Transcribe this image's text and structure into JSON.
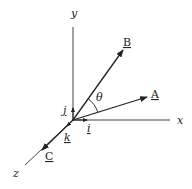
{
  "diagram": {
    "type": "3d-vector-axes",
    "axes": {
      "x_label": "x",
      "y_label": "y",
      "z_label": "z"
    },
    "unit_vectors": {
      "i_label": "i",
      "j_label": "j",
      "k_label": "k"
    },
    "vectors": {
      "A_label": "A",
      "B_label": "B",
      "C_label": "C"
    },
    "angle_label": "θ",
    "colors": {
      "line": "#333333",
      "background": "#ffffff"
    }
  }
}
